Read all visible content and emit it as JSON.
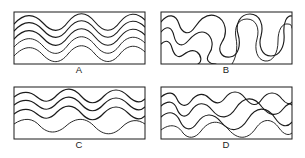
{
  "figure": {
    "type": "line-drawing-diagram",
    "background_color": "#ffffff",
    "ink_color": "#1b1b1b",
    "panel_count": 4,
    "layout": {
      "columns": 2,
      "rows": 2
    }
  },
  "panels": [
    {
      "id": "panel-a",
      "label": "A",
      "frame": {
        "x": 14,
        "y": 12,
        "width": 131,
        "height": 52
      },
      "label_pos": {
        "x": 79,
        "y": 73
      },
      "style": "rounded sinusoidal folds, many nested layers",
      "layer_count": 5,
      "curves": [
        "M 14 24 C 24 13, 34 13, 43 23 C 52 33, 60 33, 68 22 C 77 11, 86 11, 95 22 C 104 33, 112 33, 120 22 C 128 12, 137 12, 145 20",
        "M 14 31 C 24 20, 34 20, 43 30 C 52 40, 60 40, 68 29 C 77 18, 86 18, 95 29 C 104 40, 112 40, 120 29 C 128 19, 137 19, 145 27",
        "M 14 39 C 24 28, 34 28, 43 38 C 52 48, 60 48, 68 37 C 77 26, 86 26, 95 37 C 104 48, 112 48, 120 37 C 128 27, 137 27, 145 35",
        "M 14 47 C 24 36, 34 36, 43 46 C 52 56, 60 56, 68 45 C 77 34, 86 34, 95 45 C 104 56, 112 56, 120 45 C 128 35, 137 35, 145 43",
        "M 14 56 C 24 45, 34 45, 43 55 C 52 64, 60 64, 68 54 C 77 43, 86 43, 95 54 C 104 64, 112 64, 120 54 C 128 44, 137 44, 145 52"
      ]
    },
    {
      "id": "panel-b",
      "label": "B",
      "frame": {
        "x": 161,
        "y": 12,
        "width": 131,
        "height": 52
      },
      "label_pos": {
        "x": 226,
        "y": 73
      },
      "style": "tight convoluted folds, steep limbs, near-isoclinal",
      "layer_count": 4,
      "curves": [
        "M 161 22 C 168 13, 176 14, 179 24 C 182 34, 189 36, 195 27 C 201 18, 208 13, 216 16 C 226 20, 228 33, 222 42 C 217 50, 221 58, 230 57 C 239 56, 241 44, 238 34 C 235 24, 240 14, 250 14 C 260 14, 264 25, 261 36 C 258 46, 262 56, 271 56 C 280 56, 285 46, 284 34 C 283 22, 287 15, 292 16",
        "M 161 32 C 167 25, 172 27, 174 36 C 176 45, 182 48, 188 41 C 194 34, 200 30, 206 33 C 213 37, 214 47, 209 54 C 205 60, 209 64, 216 64",
        "M 161 44 C 166 39, 170 41, 172 48 C 174 55, 178 59, 183 55 C 188 51, 193 49, 197 52 C 202 56, 202 62, 198 64",
        "M 232 64 C 236 58, 238 48, 236 38 C 234 27, 238 19, 247 19 C 256 19, 260 28, 257 39 C 254 49, 257 60, 265 61 C 273 62, 278 53, 278 41 C 278 30, 282 23, 288 24 C 291 24, 292 26, 292 28"
      ]
    },
    {
      "id": "panel-c",
      "label": "C",
      "frame": {
        "x": 14,
        "y": 87,
        "width": 131,
        "height": 52
      },
      "label_pos": {
        "x": 79,
        "y": 148
      },
      "style": "open gentle folds, wide wavelength, few layers",
      "layer_count": 4,
      "curves": [
        "M 14 97 C 22 91, 30 91, 37 97 C 44 103, 50 103, 57 95 C 65 87, 73 87, 81 96 C 89 105, 96 105, 104 96 C 112 88, 120 88, 128 96 C 135 103, 141 103, 145 99",
        "M 14 105 C 22 99, 30 99, 37 105 C 44 111, 50 111, 57 103 C 65 95, 73 95, 81 104 C 89 113, 96 113, 104 104 C 112 96, 120 96, 128 104 C 135 111, 141 111, 145 107",
        "M 14 114 C 22 108, 30 108, 37 114 C 44 120, 50 120, 57 112 C 65 104, 73 104, 81 113 C 89 122, 96 122, 104 113 C 112 105, 120 105, 128 113 C 135 120, 141 120, 145 116",
        "M 14 124 C 24 117, 33 118, 40 126 C 48 134, 57 134, 66 126 C 76 117, 86 117, 95 127 C 104 136, 113 136, 122 127 C 130 119, 138 119, 145 124"
      ]
    },
    {
      "id": "panel-d",
      "label": "D",
      "frame": {
        "x": 161,
        "y": 87,
        "width": 131,
        "height": 52
      },
      "label_pos": {
        "x": 226,
        "y": 148
      },
      "style": "asymmetric chevron-like folds, sharp hinges",
      "layer_count": 4,
      "curves": [
        "M 161 97 C 168 91, 174 92, 177 99 C 180 106, 186 108, 191 101 C 196 94, 203 92, 209 98 C 215 104, 220 105, 225 98 C 231 90, 239 90, 245 98 C 251 106, 257 107, 262 99 C 268 91, 276 91, 282 99 C 286 104, 290 105, 292 102",
        "M 161 106 C 168 100, 174 101, 177 109 C 180 117, 186 119, 191 111 C 197 102, 205 101, 212 110 C 220 120, 229 119, 236 108 C 244 96, 254 96, 262 107 C 269 116, 277 117, 283 109 C 287 104, 290 103, 292 105",
        "M 161 117 C 169 110, 176 112, 180 121 C 184 130, 191 132, 197 123 C 204 113, 213 112, 221 122 C 230 133, 240 132, 248 119 C 256 106, 267 106, 275 118 C 281 127, 287 128, 292 122",
        "M 161 130 C 170 123, 178 125, 183 133 C 188 139, 195 139, 201 131 C 209 120, 220 119, 229 130 C 238 140, 248 140, 256 128 C 263 118, 272 118, 279 128 C 284 135, 289 136, 292 133"
      ]
    }
  ]
}
